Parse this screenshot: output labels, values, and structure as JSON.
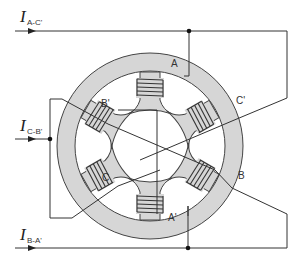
{
  "diagram": {
    "colors": {
      "stator_fill": "#d6d6d6",
      "line": "#333333",
      "background": "#ffffff"
    },
    "currents": [
      {
        "id": "iac",
        "main": "I",
        "sub": "A-C'"
      },
      {
        "id": "icb",
        "main": "I",
        "sub": "C-B'"
      },
      {
        "id": "iba",
        "main": "I",
        "sub": "B-A'"
      }
    ],
    "poles": [
      {
        "id": "A",
        "label": "A"
      },
      {
        "id": "Cp",
        "label": "C'"
      },
      {
        "id": "B",
        "label": "B"
      },
      {
        "id": "Ap",
        "label": "A'"
      },
      {
        "id": "C",
        "label": "C"
      },
      {
        "id": "Bp",
        "label": "B'"
      }
    ]
  }
}
